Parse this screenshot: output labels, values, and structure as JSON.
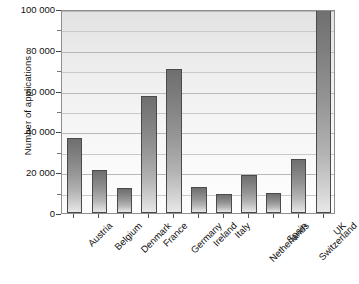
{
  "chart_data": {
    "type": "bar",
    "title": "",
    "xlabel": "",
    "ylabel": "Number of applications",
    "ylim": [
      0,
      100000
    ],
    "grid": true,
    "legend": null,
    "y_ticks_major": [
      "0",
      "20 000",
      "40 000",
      "60 000",
      "80 000",
      "100 000"
    ],
    "y_ticks_major_values": [
      0,
      20000,
      40000,
      60000,
      80000,
      100000
    ],
    "y_ticks_minor_values": [
      10000,
      30000,
      50000,
      70000,
      90000
    ],
    "categories": [
      "Austria",
      "Belgium",
      "Denmark",
      "France",
      "Germany",
      "Ireland",
      "Italy",
      "Netherlands",
      "Spain",
      "Switzerland",
      "UK"
    ],
    "values": [
      37000,
      21000,
      12500,
      57500,
      70500,
      12800,
      9500,
      18500,
      9800,
      26500,
      101000
    ],
    "bar_style": {
      "fill_top": "#6f6f6f",
      "fill_bottom": "#e8e8e8",
      "edge": "#4a4a4a"
    },
    "plot_background": "#eeeeee",
    "gridline_color": "#b9b9b9",
    "axis_color": "#555555"
  }
}
